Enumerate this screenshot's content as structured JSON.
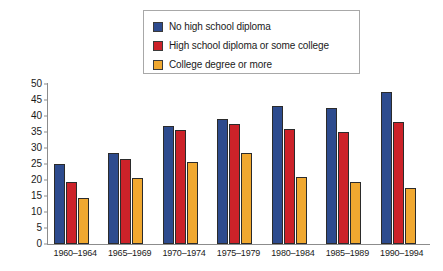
{
  "chart_data": {
    "type": "bar",
    "title": "",
    "subtitle": "",
    "xlabel": "",
    "ylabel": "",
    "ylim": [
      0,
      50
    ],
    "yticks": [
      0,
      5,
      10,
      15,
      20,
      25,
      30,
      35,
      40,
      45,
      50
    ],
    "grid": false,
    "legend_position": "top-center",
    "categories": [
      "1960–1964",
      "1965–1969",
      "1970–1974",
      "1975–1979",
      "1980–1984",
      "1985–1989",
      "1990–1994"
    ],
    "series": [
      {
        "name": "No high school diploma",
        "color": "#2d4b8e",
        "values": [
          25,
          28.5,
          37,
          39,
          43,
          42.5,
          47.5
        ]
      },
      {
        "name": "High school diploma or some college",
        "color": "#cc2229",
        "values": [
          19.5,
          26.5,
          35.5,
          37.5,
          36,
          35,
          38
        ]
      },
      {
        "name": "College degree or more",
        "color": "#f0a830",
        "values": [
          14.5,
          20.5,
          25.5,
          28.5,
          21,
          19.5,
          17.5
        ]
      }
    ]
  },
  "legend": {
    "items": [
      {
        "label": "No high school diploma",
        "color": "#2d4b8e"
      },
      {
        "label": "High school diploma or some college",
        "color": "#cc2229"
      },
      {
        "label": "College degree or more",
        "color": "#f0a830"
      }
    ]
  }
}
